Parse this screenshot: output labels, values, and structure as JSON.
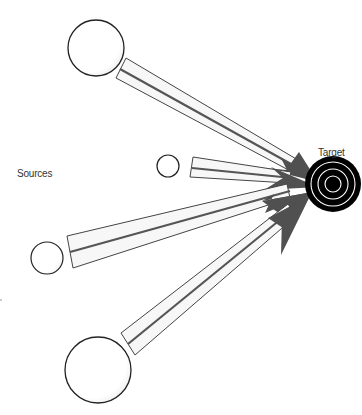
{
  "diagram": {
    "sources_label": "Sources",
    "target_label": "Target",
    "colors": {
      "arrowhead": "#505050",
      "beam_outline": "#444444",
      "beam_fill": "#f6f6f6",
      "target_fill": "#000000",
      "target_ring": "#ffffff",
      "source_outline": "#222222"
    },
    "target": {
      "cx": 333,
      "cy": 184,
      "r": 28
    },
    "sources": [
      {
        "id": "source-1",
        "cx": 96,
        "cy": 48,
        "r": 28
      },
      {
        "id": "source-2",
        "cx": 168,
        "cy": 166,
        "r": 11
      },
      {
        "id": "source-3",
        "cx": 47,
        "cy": 258,
        "r": 16
      },
      {
        "id": "source-4",
        "cx": 98,
        "cy": 370,
        "r": 33
      }
    ]
  }
}
